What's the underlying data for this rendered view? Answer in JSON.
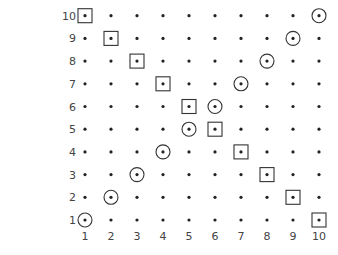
{
  "diagram": {
    "type": "dot-lattice",
    "columns": [
      1,
      2,
      3,
      4,
      5,
      6,
      7,
      8,
      9,
      10
    ],
    "rows": [
      1,
      2,
      3,
      4,
      5,
      6,
      7,
      8,
      9,
      10
    ],
    "x_labels": [
      "1",
      "2",
      "3",
      "4",
      "5",
      "6",
      "7",
      "8",
      "9",
      "10"
    ],
    "y_labels": [
      "1",
      "2",
      "3",
      "4",
      "5",
      "6",
      "7",
      "8",
      "9",
      "10"
    ],
    "circled_points": [
      [
        1,
        1
      ],
      [
        2,
        2
      ],
      [
        3,
        3
      ],
      [
        4,
        4
      ],
      [
        5,
        5
      ],
      [
        6,
        6
      ],
      [
        7,
        7
      ],
      [
        8,
        8
      ],
      [
        9,
        9
      ],
      [
        10,
        10
      ]
    ],
    "boxed_points": [
      [
        1,
        10
      ],
      [
        2,
        9
      ],
      [
        3,
        8
      ],
      [
        4,
        7
      ],
      [
        5,
        6
      ],
      [
        6,
        5
      ],
      [
        7,
        4
      ],
      [
        8,
        3
      ],
      [
        9,
        2
      ],
      [
        10,
        1
      ]
    ],
    "colors": {
      "dot": "#222222",
      "marker": "#333333",
      "label": "#444444",
      "background": "#ffffff"
    }
  }
}
